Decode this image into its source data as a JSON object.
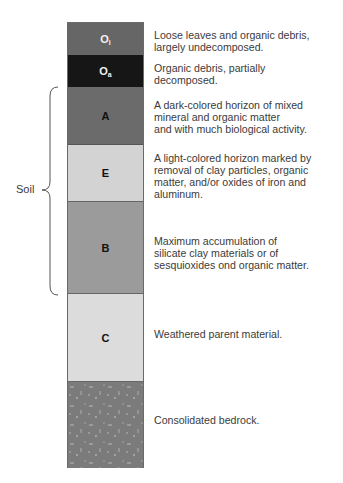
{
  "diagram": {
    "bracket_label": "Soil",
    "layers": [
      {
        "id": "Oi",
        "main": "O",
        "sub": "i",
        "color": "#666666",
        "top": 0,
        "height": 32,
        "label_color": "light",
        "description": "Loose leaves and organic debris,\nlargely undecomposed."
      },
      {
        "id": "Oa",
        "main": "O",
        "sub": "a",
        "color": "#161616",
        "top": 32,
        "height": 32,
        "label_color": "light",
        "description": "Organic debris, partially\ndecomposed."
      },
      {
        "id": "A",
        "main": "A",
        "sub": "",
        "color": "#6b6b6b",
        "top": 64,
        "height": 58,
        "label_color": "dark",
        "description": "A dark-colored horizon of mixed\nmineral and organic matter\nand with much biological activity."
      },
      {
        "id": "E",
        "main": "E",
        "sub": "",
        "color": "#d3d3d3",
        "top": 122,
        "height": 57,
        "label_color": "dark",
        "description": "A light-colored horizon marked by\nremoval of clay particles, organic\nmatter, and/or oxides of iron and\naluminum."
      },
      {
        "id": "B",
        "main": "B",
        "sub": "",
        "color": "#9b9b9b",
        "top": 179,
        "height": 92,
        "label_color": "dark",
        "description": "Maximum accumulation of\nsilicate clay materials or of\nsesquioxides ond organic matter."
      },
      {
        "id": "C",
        "main": "C",
        "sub": "",
        "color": "#dcdcdc",
        "top": 271,
        "height": 88,
        "label_color": "dark",
        "description": "Weathered parent material."
      },
      {
        "id": "R",
        "main": "",
        "sub": "",
        "color": "#7b7b7b",
        "top": 359,
        "height": 87,
        "label_color": "dark",
        "description": "Consolidated bedrock."
      }
    ]
  }
}
